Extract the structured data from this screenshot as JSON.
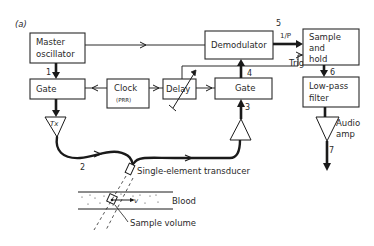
{
  "figure": {
    "panel_label": "(a)",
    "blocks": {
      "master_oscillator": {
        "line1": "Master",
        "line2": "oscillator"
      },
      "gate_tx": {
        "label": "Gate"
      },
      "clock": {
        "label": "Clock",
        "sublabel": "(PRR)"
      },
      "delay": {
        "label": "Delay"
      },
      "gate_rx": {
        "label": "Gate"
      },
      "demodulator": {
        "label": "Demodulator"
      },
      "sample_hold": {
        "line1": "Sample",
        "line2": "and",
        "line3": "hold"
      },
      "low_pass_filter": {
        "line1": "Low-pass",
        "line2": "filter"
      }
    },
    "amplifiers": {
      "tx": {
        "label": "Tx"
      },
      "rx": {
        "label": ""
      },
      "audio": {
        "line1": "Audio",
        "line2": "amp"
      }
    },
    "signal_labels": {
      "trig": "Trig",
      "output_1p": "1/P"
    },
    "node_numbers": [
      "1",
      "2",
      "3",
      "4",
      "5",
      "6",
      "7"
    ],
    "annotations": {
      "transducer": "Single-element transducer",
      "blood": "Blood",
      "velocity": "v",
      "sample_volume": "Sample volume"
    },
    "colors": {
      "ink": "#1a1a1a",
      "background": "#ffffff"
    }
  }
}
